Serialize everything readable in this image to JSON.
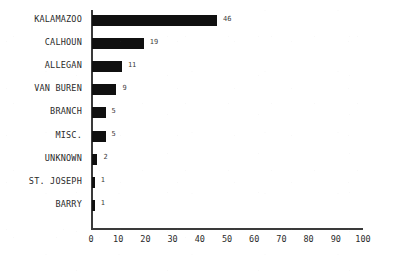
{
  "chart_data": {
    "type": "bar",
    "orientation": "horizontal",
    "title": "",
    "subtitle": "",
    "xlabel": "",
    "ylabel": "",
    "categories": [
      "KALAMAZOO",
      "CALHOUN",
      "ALLEGAN",
      "VAN BUREN",
      "BRANCH",
      "MISC.",
      "UNKNOWN",
      "ST. JOSEPH",
      "BARRY"
    ],
    "values": [
      46,
      19,
      11,
      9,
      5,
      5,
      2,
      1,
      1
    ],
    "value_labels": [
      "46",
      "19",
      "11",
      "9",
      "5",
      "5",
      "2",
      "1",
      "1"
    ],
    "xlim": [
      0,
      100
    ],
    "xticks": [
      0,
      10,
      20,
      30,
      40,
      50,
      60,
      70,
      80,
      90,
      100
    ],
    "xtick_labels": [
      "0",
      "10",
      "20",
      "30",
      "40",
      "50",
      "60",
      "70",
      "80",
      "90",
      "100"
    ],
    "grid": false,
    "legend": null,
    "bar_color": "#101010",
    "axis_color": "#3a3a3a",
    "background_color": "#ffffff"
  }
}
